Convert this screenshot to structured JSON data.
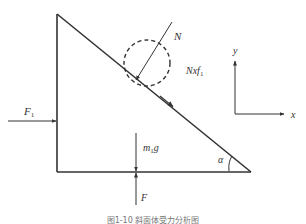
{
  "diagram": {
    "labels": {
      "normal_force": "N",
      "friction_force": "Nxf",
      "friction_sub": "1",
      "applied_force": "F",
      "applied_sub": "1",
      "weight_m": "m",
      "weight_sub": "1",
      "weight_g": "g",
      "support_force": "F",
      "angle": "α",
      "axis_y": "y",
      "axis_x": "x"
    },
    "caption": "图1-10  斜面体受力分析图",
    "colors": {
      "line": "#333333",
      "dashed_circle": "#333333",
      "background": "#ffffff"
    }
  }
}
